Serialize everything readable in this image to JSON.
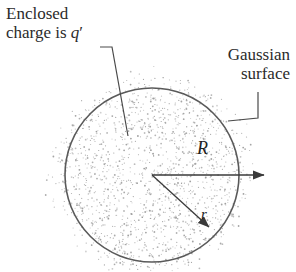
{
  "figure": {
    "background_color": "#ffffff",
    "ink_color": "#4a4a4a",
    "text_color": "#2b2b2b",
    "stipple_color": "#9a9a9a"
  },
  "labels": {
    "enclosed_line1": "Enclosed",
    "enclosed_line2_prefix": "charge is ",
    "enclosed_symbol": "q",
    "enclosed_prime": "′",
    "gaussian_line1": "Gaussian",
    "gaussian_line2": "surface",
    "radius_outer": "R",
    "radius_inner": "r"
  },
  "geometry": {
    "circle": {
      "cx": 152,
      "cy": 175,
      "r": 87
    },
    "center_point": {
      "x": 152,
      "y": 175
    },
    "arrow_R": {
      "x1": 152,
      "y1": 175,
      "x2": 266,
      "y2": 175
    },
    "arrow_r": {
      "x1": 152,
      "y1": 175,
      "x2": 211,
      "y2": 229
    },
    "leader_enclosed": "M100,47 L112,47 L128,136",
    "leader_gaussian": "M258,92 L258,118 L228,121",
    "stipple_outer_radius": 112,
    "stipple_dot_count": 2100
  },
  "chart_data": {
    "type": "diagram",
    "annotations": [
      "Enclosed charge is q′",
      "Gaussian surface",
      "R",
      "r"
    ]
  }
}
